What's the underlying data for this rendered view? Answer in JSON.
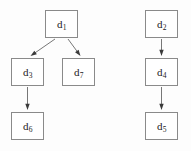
{
  "diagram": {
    "background_color": "#fdfdfd",
    "node_fill": "#ffffff",
    "node_border_color": "#8a8a8a",
    "edge_color": "#777777",
    "label_color": "#1a1a1a",
    "width": 191,
    "height": 151,
    "nodes": [
      {
        "id": "d1",
        "base": "d",
        "subscript": "1",
        "label": "d1",
        "x": 45,
        "y": 10,
        "w": 33,
        "h": 28
      },
      {
        "id": "d3",
        "base": "d",
        "subscript": "3",
        "label": "d3",
        "x": 11,
        "y": 58,
        "w": 33,
        "h": 28
      },
      {
        "id": "d7",
        "base": "d",
        "subscript": "7",
        "label": "d7",
        "x": 62,
        "y": 58,
        "w": 33,
        "h": 28
      },
      {
        "id": "d6",
        "base": "d",
        "subscript": "6",
        "label": "d6",
        "x": 11,
        "y": 112,
        "w": 33,
        "h": 28
      },
      {
        "id": "d2",
        "base": "d",
        "subscript": "2",
        "label": "d2",
        "x": 145,
        "y": 10,
        "w": 33,
        "h": 28
      },
      {
        "id": "d4",
        "base": "d",
        "subscript": "4",
        "label": "d4",
        "x": 145,
        "y": 58,
        "w": 33,
        "h": 28
      },
      {
        "id": "d5",
        "base": "d",
        "subscript": "5",
        "label": "d5",
        "x": 145,
        "y": 112,
        "w": 33,
        "h": 28
      }
    ],
    "edges": [
      {
        "id": "e1",
        "from": "d1",
        "to": "d3",
        "x1": 55,
        "y1": 39,
        "x2": 30.5,
        "y2": 56,
        "name": "edge-d1-d3"
      },
      {
        "id": "e2",
        "from": "d1",
        "to": "d7",
        "x1": 68,
        "y1": 39,
        "x2": 80.5,
        "y2": 56,
        "name": "edge-d1-d7"
      },
      {
        "id": "e3",
        "from": "d3",
        "to": "d6",
        "x1": 27.5,
        "y1": 87,
        "x2": 27.5,
        "y2": 110,
        "name": "edge-d3-d6"
      },
      {
        "id": "e4",
        "from": "d2",
        "to": "d4",
        "x1": 161.5,
        "y1": 39,
        "x2": 161.5,
        "y2": 56,
        "name": "edge-d2-d4"
      },
      {
        "id": "e5",
        "from": "d4",
        "to": "d5",
        "x1": 161.5,
        "y1": 87,
        "x2": 161.5,
        "y2": 110,
        "name": "edge-d4-d5"
      }
    ]
  }
}
